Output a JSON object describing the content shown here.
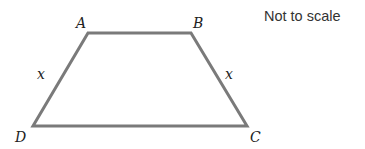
{
  "diagram": {
    "type": "trapezium",
    "note": "Not to scale",
    "stroke_color": "#7a7a7a",
    "vertices": [
      {
        "label": "A",
        "x": 88,
        "y": 33
      },
      {
        "label": "B",
        "x": 191,
        "y": 33
      },
      {
        "label": "C",
        "x": 247,
        "y": 126
      },
      {
        "label": "D",
        "x": 33,
        "y": 126
      }
    ],
    "side_labels": [
      {
        "side": "AD",
        "label": "x"
      },
      {
        "side": "BC",
        "label": "x"
      }
    ]
  }
}
